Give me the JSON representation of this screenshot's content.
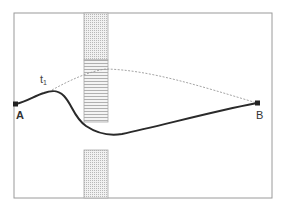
{
  "diagram": {
    "frame": {
      "x": 14,
      "y": 13,
      "width": 258,
      "height": 185,
      "stroke": "#9a9a9a"
    },
    "barriers": [
      {
        "name": "upper-barrier-top",
        "x": 84,
        "y": 13,
        "width": 24,
        "height": 47,
        "pattern": "vertical-dots"
      },
      {
        "name": "upper-barrier-bottom",
        "x": 84,
        "y": 60,
        "width": 24,
        "height": 62,
        "pattern": "horizontal-lines"
      },
      {
        "name": "lower-barrier",
        "x": 84,
        "y": 150,
        "width": 24,
        "height": 48,
        "pattern": "vertical-dots"
      }
    ],
    "paths": {
      "solid": {
        "d": "M16,104 C28,101 34,96 44,93 C52,90 58,90 64,96 C72,104 74,118 86,126 C98,134 110,136 122,134 C160,126 210,112 257,103",
        "stroke": "#2a2a2a"
      },
      "dashed": {
        "d": "M52,90 C70,80 90,71 106,69 C150,70 200,86 257,103",
        "stroke": "#9a9a9a"
      }
    },
    "points": {
      "A": {
        "x": 16,
        "y": 104,
        "label": "A"
      },
      "B": {
        "x": 257,
        "y": 103,
        "label": "B"
      }
    },
    "labels": {
      "t1_main": "t",
      "t1_sub": "1",
      "A": "A",
      "B": "B"
    }
  }
}
